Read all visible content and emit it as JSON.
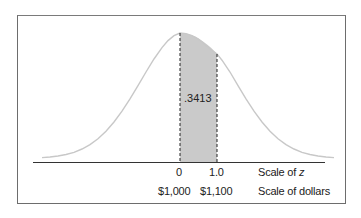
{
  "diagram": {
    "shaded_area_label": ".3413",
    "z_scale": {
      "ticks": [
        "0",
        "1.0"
      ],
      "label_prefix": "Scale of ",
      "label_var": "z"
    },
    "dollar_scale": {
      "ticks": [
        "$1,000",
        "$1,100"
      ],
      "label": "Scale of dollars"
    },
    "colors": {
      "curve": "#c8c8c8",
      "shade": "#c4c4c4",
      "axis": "#333333",
      "dashed": "#222222",
      "frame": "#6d6d6d"
    }
  }
}
